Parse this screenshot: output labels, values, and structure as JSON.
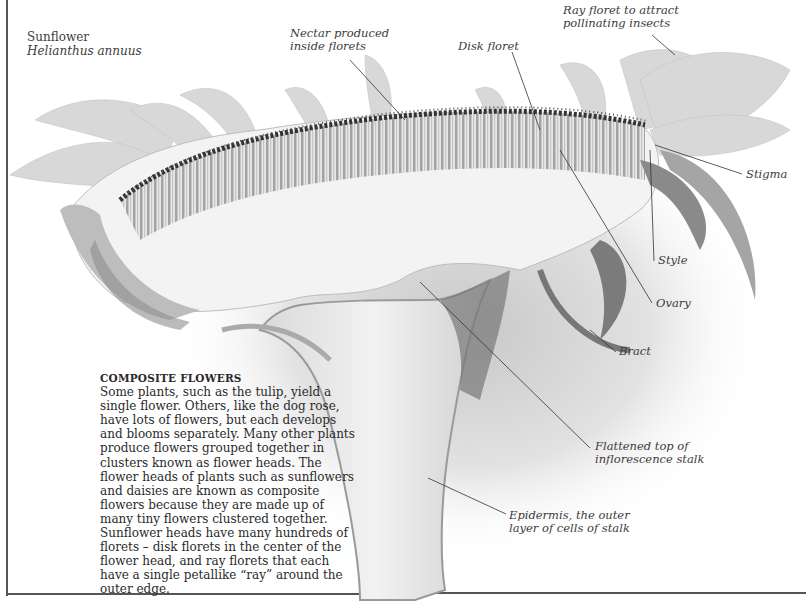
{
  "title": {
    "common_name": "Sunflower",
    "scientific_name": "Helianthus annuus"
  },
  "labels": [
    {
      "id": "nectar",
      "lines": [
        "Nectar produced",
        "inside florets"
      ]
    },
    {
      "id": "disk-floret",
      "lines": [
        "Disk floret"
      ]
    },
    {
      "id": "ray-floret",
      "lines": [
        "Ray floret to attract",
        "pollinating insects"
      ]
    },
    {
      "id": "stigma",
      "lines": [
        "Stigma"
      ]
    },
    {
      "id": "style",
      "lines": [
        "Style"
      ]
    },
    {
      "id": "ovary",
      "lines": [
        "Ovary"
      ]
    },
    {
      "id": "bract",
      "lines": [
        "Bract"
      ]
    },
    {
      "id": "flattened-top",
      "lines": [
        "Flattened top of",
        "inflorescence stalk"
      ]
    },
    {
      "id": "epidermis",
      "lines": [
        "Epidermis, the outer",
        "layer of cells of stalk"
      ]
    }
  ],
  "sidebar_text": {
    "heading": "COMPOSITE FLOWERS",
    "body": "Some plants, such as the tulip, yield a single flower. Others, like the dog rose, have lots of flowers, but each develops and blooms separately. Many other plants produce flowers grouped together in clusters known as flower heads. The flower heads of plants such as sunflowers and daisies are known as composite flowers because they are made up of many tiny flowers clustered together. Sunflower heads have many hundreds of florets – disk florets in the center of the flower head, and ray florets that each have a single petallike “ray” around the outer edge."
  },
  "image": {
    "subject": "sunflower-head-cross-section",
    "tone": "grayscale"
  }
}
